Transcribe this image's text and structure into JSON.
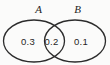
{
  "diagram": {
    "type": "venn",
    "title": "",
    "sets": [
      {
        "label": "A",
        "value": "0.3"
      },
      {
        "label": "B",
        "value": "0.1"
      }
    ],
    "intersection": {
      "value": "0.2"
    },
    "colors": {
      "stroke": "#2b2b2b",
      "text": "#1f1f1f",
      "background": "#fbfbfa"
    }
  }
}
